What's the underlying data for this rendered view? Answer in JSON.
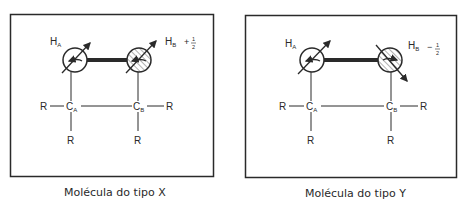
{
  "panels": [
    {
      "id": "X",
      "caption": "Molécula do tipo X",
      "hA": {
        "label": "H",
        "sub": "A"
      },
      "hB": {
        "label": "H",
        "sub": "B",
        "spin_sign": "+",
        "spin_num": "1",
        "spin_den": "2"
      },
      "cA": {
        "label": "C",
        "sub": "A"
      },
      "cB": {
        "label": "C",
        "sub": "B"
      },
      "substituent": "R",
      "hB_arrow_direction": "up-right (parallel)"
    },
    {
      "id": "Y",
      "caption": "Molécula do tipo Y",
      "hA": {
        "label": "H",
        "sub": "A"
      },
      "hB": {
        "label": "H",
        "sub": "B",
        "spin_sign": "−",
        "spin_num": "1",
        "spin_den": "2"
      },
      "cA": {
        "label": "C",
        "sub": "A"
      },
      "cB": {
        "label": "C",
        "sub": "B"
      },
      "substituent": "R",
      "hB_arrow_direction": "down-right (antiparallel)"
    }
  ],
  "colors": {
    "line": "#2a2a2a",
    "hatch": "#555555",
    "background": "#ffffff"
  }
}
